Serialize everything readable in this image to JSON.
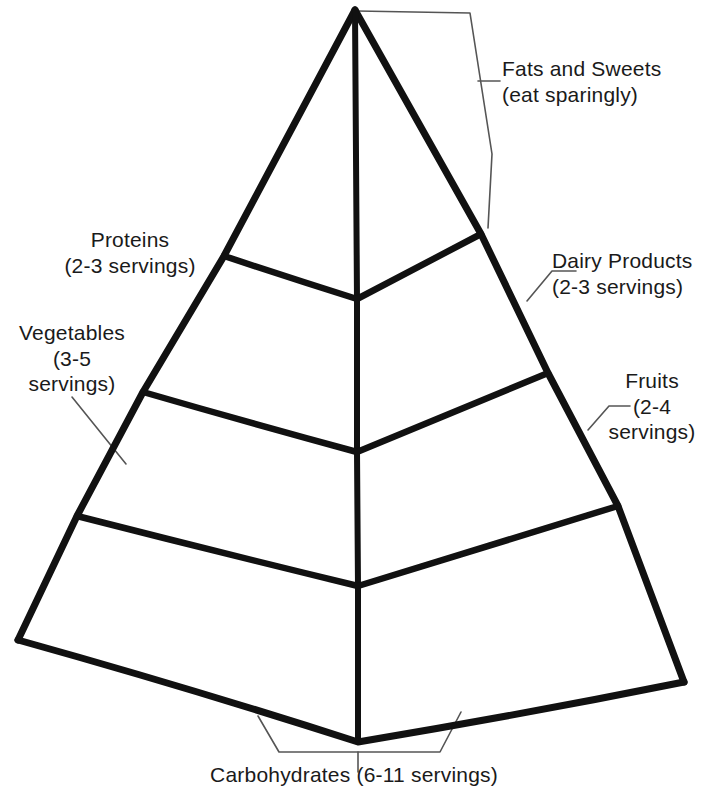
{
  "diagram": {
    "kind": "food-pyramid",
    "ink_color": "#111111",
    "leader_color": "#555555",
    "background_color": "#ffffff"
  },
  "labels": {
    "fats_sweets": "Fats and Sweets\n(eat sparingly)",
    "proteins": "Proteins\n(2-3 servings)",
    "dairy": "Dairy Products\n(2-3 servings)",
    "vegetables": "Vegetables\n(3-5\nservings)",
    "fruits": "Fruits\n(2-4\nservings)",
    "carbohydrates": "Carbohydrates (6-11 servings)"
  },
  "tiers": [
    {
      "name": "fats-and-sweets",
      "food": "Fats and Sweets",
      "servings": "eat sparingly"
    },
    {
      "name": "proteins",
      "food": "Proteins",
      "servings": "2-3 servings"
    },
    {
      "name": "dairy-products",
      "food": "Dairy Products",
      "servings": "2-3 servings"
    },
    {
      "name": "vegetables",
      "food": "Vegetables",
      "servings": "3-5 servings"
    },
    {
      "name": "fruits",
      "food": "Fruits",
      "servings": "2-4 servings"
    },
    {
      "name": "carbohydrates",
      "food": "Carbohydrates",
      "servings": "6-11 servings"
    }
  ]
}
